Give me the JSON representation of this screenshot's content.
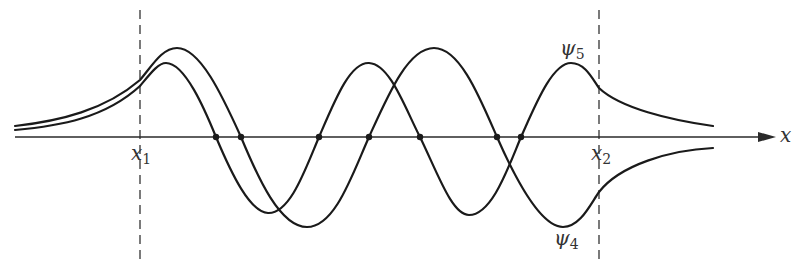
{
  "diagram": {
    "title": "",
    "axis": {
      "label": "x",
      "color": "#2a2a2a"
    },
    "boundaries": [
      {
        "label": "x",
        "subscript": "1",
        "x_px": 140
      },
      {
        "label": "x",
        "subscript": "2",
        "x_px": 599
      }
    ],
    "curves": [
      {
        "name": "psi_5",
        "label": "ψ",
        "subscript": "5",
        "nodes_px": [
          216,
          319,
          420,
          521
        ],
        "tail_right": "above axis"
      },
      {
        "name": "psi_4",
        "label": "ψ",
        "subscript": "4",
        "nodes_px": [
          241,
          369,
          497
        ],
        "tail_right": "below axis"
      }
    ],
    "line_color": "#1a1a1a"
  }
}
